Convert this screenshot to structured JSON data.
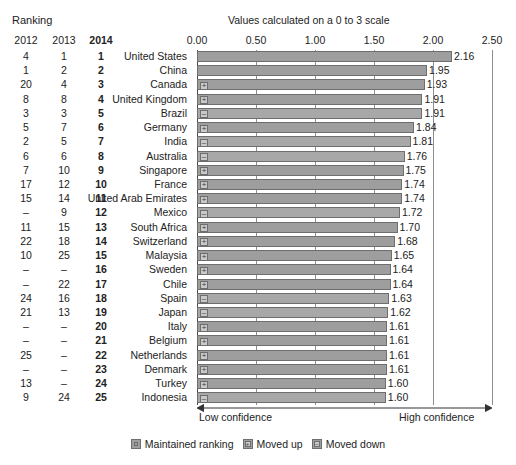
{
  "header": {
    "ranking_label": "Ranking",
    "scale_note": "Values calculated on a 0 to 3 scale",
    "year_2012": "2012",
    "year_2013": "2013",
    "year_2014": "2014"
  },
  "axis": {
    "ticks": [
      "0.00",
      "0.50",
      "1.00",
      "1.50",
      "2.00",
      "2.50"
    ],
    "low_label": "Low confidence",
    "high_label": "High confidence"
  },
  "legend": {
    "maintained": "Maintained ranking",
    "moved_up": "Moved up",
    "moved_down": "Moved down",
    "up_glyph": "+",
    "down_glyph": "–"
  },
  "chart_data": {
    "type": "bar",
    "title": "",
    "subtitle": "Values calculated on a 0 to 3 scale",
    "xlabel": "",
    "ylabel": "",
    "xlim": [
      0.0,
      2.5
    ],
    "xticks": [
      0.0,
      0.5,
      1.0,
      1.5,
      2.0,
      2.5
    ],
    "grid": true,
    "orientation": "horizontal",
    "legend_position": "bottom",
    "categories": [
      "United States",
      "China",
      "Canada",
      "United Kingdom",
      "Brazil",
      "Germany",
      "India",
      "Australia",
      "Singapore",
      "France",
      "United Arab Emirates",
      "Mexico",
      "South Africa",
      "Switzerland",
      "Malaysia",
      "Sweden",
      "Chile",
      "Spain",
      "Japan",
      "Italy",
      "Belgium",
      "Netherlands",
      "Denmark",
      "Turkey",
      "Indonesia"
    ],
    "values": [
      2.16,
      1.95,
      1.93,
      1.91,
      1.91,
      1.84,
      1.81,
      1.76,
      1.75,
      1.74,
      1.74,
      1.72,
      1.7,
      1.68,
      1.65,
      1.64,
      1.64,
      1.63,
      1.62,
      1.61,
      1.61,
      1.61,
      1.61,
      1.6,
      1.6
    ],
    "value_labels": [
      "2.16",
      "1.95",
      "1.93",
      "1.91",
      "1.91",
      "1.84",
      "1.81",
      "1.76",
      "1.75",
      "1.74",
      "1.74",
      "1.72",
      "1.70",
      "1.68",
      "1.65",
      "1.64",
      "1.64",
      "1.63",
      "1.62",
      "1.61",
      "1.61",
      "1.61",
      "1.61",
      "1.60",
      "1.60"
    ],
    "rank_2012": [
      "4",
      "1",
      "20",
      "8",
      "3",
      "5",
      "2",
      "6",
      "7",
      "17",
      "15",
      "–",
      "11",
      "22",
      "10",
      "–",
      "–",
      "24",
      "21",
      "–",
      "–",
      "25",
      "–",
      "13",
      "9"
    ],
    "rank_2013": [
      "1",
      "2",
      "4",
      "8",
      "3",
      "7",
      "5",
      "6",
      "10",
      "12",
      "14",
      "9",
      "15",
      "18",
      "25",
      "–",
      "22",
      "16",
      "13",
      "–",
      "–",
      "–",
      "–",
      "–",
      "24"
    ],
    "rank_2014": [
      "1",
      "2",
      "3",
      "4",
      "5",
      "6",
      "7",
      "8",
      "9",
      "10",
      "11",
      "12",
      "13",
      "14",
      "15",
      "16",
      "17",
      "18",
      "19",
      "20",
      "21",
      "22",
      "23",
      "24",
      "25"
    ],
    "movement": [
      "maintained",
      "maintained",
      "up",
      "up",
      "down",
      "up",
      "down",
      "down",
      "up",
      "up",
      "up",
      "down",
      "up",
      "up",
      "up",
      "up",
      "up",
      "down",
      "down",
      "up",
      "up",
      "up",
      "up",
      "up",
      "down"
    ],
    "series": [
      {
        "name": "Confidence index value",
        "values": [
          2.16,
          1.95,
          1.93,
          1.91,
          1.91,
          1.84,
          1.81,
          1.76,
          1.75,
          1.74,
          1.74,
          1.72,
          1.7,
          1.68,
          1.65,
          1.64,
          1.64,
          1.63,
          1.62,
          1.61,
          1.61,
          1.61,
          1.61,
          1.6,
          1.6
        ]
      }
    ]
  },
  "colors": {
    "bar": "#9e9e9e",
    "bar_border": "#6e6e6e",
    "marker": "#c9c9c9",
    "grid": "#8d8d8d",
    "text": "#222222"
  }
}
